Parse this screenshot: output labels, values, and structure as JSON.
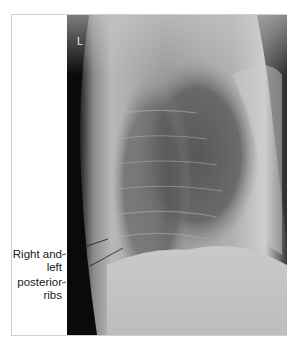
{
  "figure": {
    "type": "lateral chest radiograph",
    "side_marker": "L",
    "annotations": [
      {
        "id": "right-left-label",
        "lines": [
          "Right and",
          "left"
        ]
      },
      {
        "id": "posterior-ribs-label",
        "lines": [
          "posterior",
          "ribs"
        ]
      }
    ],
    "colors": {
      "background": "#ffffff",
      "frame_border": "#cfcfcf",
      "xray_dark": "#0a0a0a",
      "xray_light": "#d8d8d8",
      "text": "#1a1a1a"
    }
  }
}
